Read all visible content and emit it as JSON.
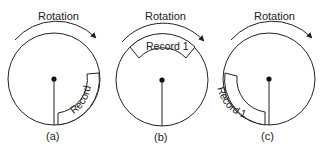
{
  "diagram": {
    "panels": [
      {
        "id": "a",
        "caption": "(a)",
        "rotation_label": "Rotation",
        "record_label": "Record 1",
        "record_position": "lower-right"
      },
      {
        "id": "b",
        "caption": "(b)",
        "rotation_label": "Rotation",
        "record_label": "Record 1",
        "record_position": "top"
      },
      {
        "id": "c",
        "caption": "(c)",
        "rotation_label": "Rotation",
        "record_label": "Record 1",
        "record_position": "lower-left"
      }
    ],
    "colors": {
      "stroke": "#222222",
      "background": "#ffffff"
    }
  }
}
